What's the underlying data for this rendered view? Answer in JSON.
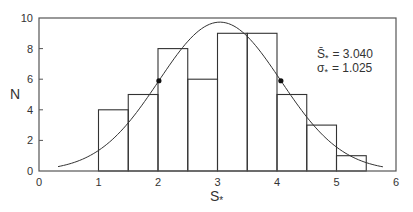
{
  "chart_data": {
    "type": "bar",
    "subtype": "histogram-with-normal-fit",
    "title": "",
    "xlabel": "S*",
    "ylabel": "N",
    "xlim": [
      0,
      6
    ],
    "ylim": [
      0,
      10
    ],
    "xticks": [
      "0",
      "1",
      "2",
      "3",
      "4",
      "5",
      "6"
    ],
    "yticks": [
      "0",
      "2",
      "4",
      "6",
      "8",
      "10"
    ],
    "grid": false,
    "legend": null,
    "bin_width": 0.5,
    "categories": [
      "1.0-1.5",
      "1.5-2.0",
      "2.0-2.5",
      "2.5-3.0",
      "3.0-3.5",
      "3.5-4.0",
      "4.0-4.5",
      "4.5-5.0",
      "5.0-5.5"
    ],
    "bins": [
      {
        "x0": 1.0,
        "x1": 1.5,
        "count": 4
      },
      {
        "x0": 1.5,
        "x1": 2.0,
        "count": 5
      },
      {
        "x0": 2.0,
        "x1": 2.5,
        "count": 8
      },
      {
        "x0": 2.5,
        "x1": 3.0,
        "count": 6
      },
      {
        "x0": 3.0,
        "x1": 3.5,
        "count": 9
      },
      {
        "x0": 3.5,
        "x1": 4.0,
        "count": 9
      },
      {
        "x0": 4.0,
        "x1": 4.5,
        "count": 5
      },
      {
        "x0": 4.5,
        "x1": 5.0,
        "count": 3
      },
      {
        "x0": 5.0,
        "x1": 5.5,
        "count": 1
      }
    ],
    "values": [
      4,
      5,
      8,
      6,
      9,
      9,
      5,
      3,
      1
    ],
    "series": [
      {
        "name": "histogram",
        "type": "bar",
        "values": [
          4,
          5,
          8,
          6,
          9,
          9,
          5,
          3,
          1
        ]
      },
      {
        "name": "normal fit",
        "type": "line",
        "mean": 3.04,
        "sigma": 1.025,
        "x_range": [
          0.32,
          5.78
        ],
        "peak": 9.73
      },
      {
        "name": "inflection points",
        "type": "scatter",
        "points": [
          [
            2.015,
            5.9
          ],
          [
            4.065,
            5.9
          ]
        ]
      }
    ],
    "annotations": [
      {
        "text": "S̄* = 3.040",
        "symbol": "S̄",
        "sub": "*",
        "value": "3.040"
      },
      {
        "text": "σ* = 1.025",
        "symbol": "σ",
        "sub": "*",
        "value": "1.025"
      }
    ]
  },
  "labels": {
    "xlabel_main": "S",
    "xlabel_sub": "*",
    "ylabel": "N",
    "mean_symbol": "S̄",
    "mean_sub": "*",
    "mean_eq": "= 3.040",
    "sigma_symbol": "σ",
    "sigma_sub": "*",
    "sigma_eq": "= 1.025"
  },
  "colors": {
    "line": "#333333",
    "axis": "#555555",
    "text": "#333333",
    "background": "#ffffff"
  }
}
